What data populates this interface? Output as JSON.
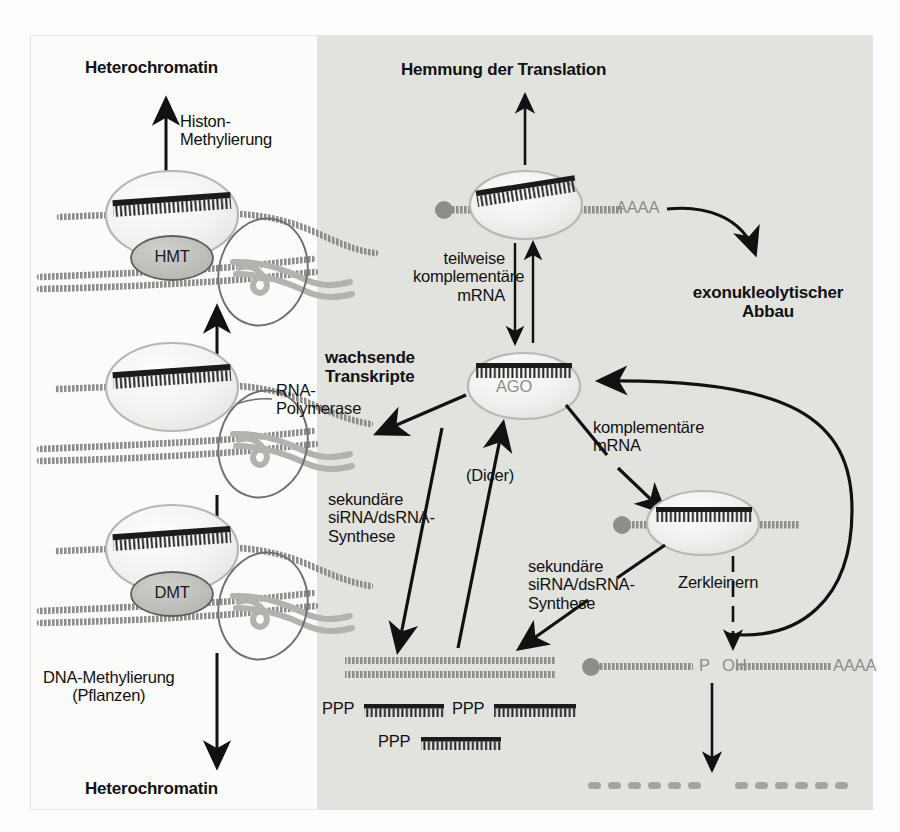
{
  "figure": {
    "language": "de",
    "background_left": "#fbfbfa",
    "background_right_panel": "#e2e2df",
    "ink_color": "#111111",
    "nucleic_acid_gray": "#8d8d8b",
    "protein_outline_gray": "#a9a9a6"
  },
  "left_branch": {
    "top_heading": "Heterochromatin",
    "histone_methylation_label": "Histon-\nMethylierung",
    "hmt_label": "HMT",
    "rna_polymerase_label": "RNA-\nPolymerase",
    "dmt_label": "DMT",
    "dna_methylation_label": "DNA-Methylierung\n(Pflanzen)",
    "bottom_heading": "Heterochromatin"
  },
  "right_branch": {
    "top_heading": "Hemmung der Translation",
    "partial_complementary_label": "teilweise\nkomplementäre\nmRNA",
    "poly_a_tail": "AAAA",
    "exonucleolytic_label": "exonukleolytischer\nAbbau",
    "ago_label": "AGO",
    "growing_transcripts_label": "wachsende\nTranskripte",
    "complementary_mrna_label": "komplementäre\nmRNA",
    "dicer_label": "(Dicer)",
    "secondary_sirna_left_label": "sekundäre\nsiRNA/dsRNA-\nSynthese",
    "secondary_sirna_right_label": "sekundäre\nsiRNA/dsRNA-\nSynthese",
    "slicing_label": "Zerkleinern",
    "cleaved_5prime_label": "OH",
    "cleaved_3prime_label": "P",
    "cleaved_poly_a": "AAAA",
    "sirna_triphosphate_label": "PPP",
    "sirna_rows": [
      {
        "label": "PPP",
        "x": 322,
        "y": 705,
        "strand_width": 78
      },
      {
        "label": "PPP",
        "x": 452,
        "y": 705,
        "strand_width": 80
      },
      {
        "label": "PPP",
        "x": 378,
        "y": 737,
        "strand_width": 78
      }
    ]
  },
  "icon_names": {
    "nucleosome": "nucleosome-icon",
    "ago_protein": "ago-protein-icon",
    "hmt_enzyme": "hmt-enzyme-icon",
    "dmt_enzyme": "dmt-enzyme-icon",
    "rna_polymerase": "rna-polymerase-icon",
    "dsrna_duplex": "dsrna-duplex-icon",
    "sirna_strand": "sirna-strand-icon",
    "degraded_rna": "degraded-rna-dots-icon",
    "arrow": "arrow-icon",
    "curved_arrow": "curved-arrow-icon"
  }
}
